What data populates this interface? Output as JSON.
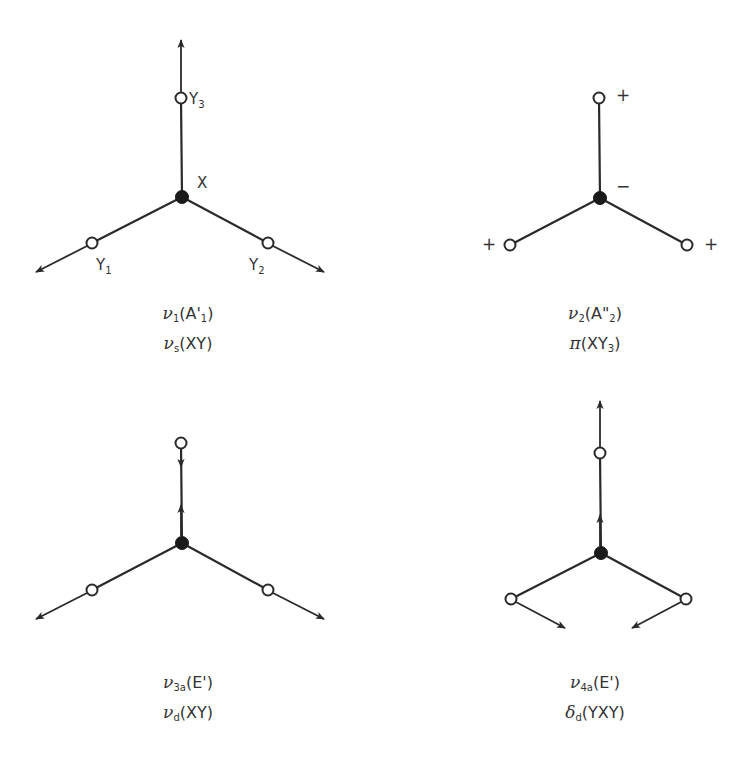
{
  "figure": {
    "panels": [
      {
        "id": "nu1",
        "atom_labels": {
          "center": "X",
          "top": "Y",
          "top_sub": "3",
          "left": "Y",
          "left_sub": "1",
          "right": "Y",
          "right_sub": "2"
        },
        "caption": {
          "line1": {
            "symbol": "ν",
            "sub": "1",
            "text_pre": "(A'",
            "text_sub": "1",
            "text_post": ")"
          },
          "line2": {
            "symbol": "ν",
            "sub": "s",
            "text_pre": "(XY",
            "text_sub": "",
            "text_post": ")"
          }
        },
        "description": "symmetric stretch: all three Y atoms move outward"
      },
      {
        "id": "nu2",
        "signs": {
          "center": "−",
          "top": "+",
          "left": "+",
          "right": "+"
        },
        "caption": {
          "line1": {
            "symbol": "ν",
            "sub": "2",
            "text_pre": "(A\"",
            "text_sub": "2",
            "text_post": ")"
          },
          "line2": {
            "symbol": "π",
            "sub": "",
            "text_pre": "(XY",
            "text_sub": "3",
            "text_post": ")"
          }
        },
        "description": "out-of-plane bend: Y atoms up (+), X down (−)"
      },
      {
        "id": "nu3a",
        "caption": {
          "line1": {
            "symbol": "ν",
            "sub": "3a",
            "text_pre": "(E'",
            "text_sub": "",
            "text_post": ")"
          },
          "line2": {
            "symbol": "ν",
            "sub": "d",
            "text_pre": "(XY",
            "text_sub": "",
            "text_post": ")"
          }
        },
        "description": "degenerate stretch"
      },
      {
        "id": "nu4a",
        "caption": {
          "line1": {
            "symbol": "ν",
            "sub": "4a",
            "text_pre": "(E'",
            "text_sub": "",
            "text_post": ")"
          },
          "line2": {
            "symbol": "δ",
            "sub": "d",
            "text_pre": "(YXY",
            "text_sub": "",
            "text_post": ")"
          }
        },
        "description": "degenerate in-plane bend"
      }
    ]
  },
  "colors": {
    "ink": "#2a2a2a",
    "background": "#ffffff"
  }
}
